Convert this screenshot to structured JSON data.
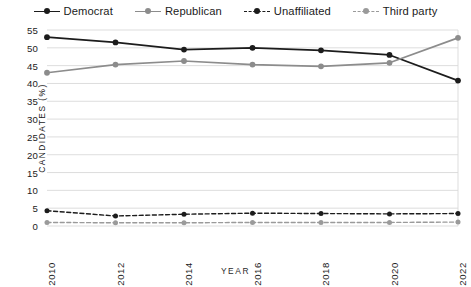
{
  "chart_data": {
    "type": "line",
    "title": "",
    "subtitle": "",
    "xlabel": "YEAR",
    "ylabel": "CANDIDATES (%)",
    "x": [
      2010,
      2012,
      2014,
      2016,
      2018,
      2020,
      2022
    ],
    "xtick_labels": [
      "2010",
      "2012",
      "2014",
      "2016",
      "2018",
      "2020",
      "2022"
    ],
    "ylim": [
      0,
      55
    ],
    "yticks": [
      0,
      5,
      10,
      15,
      20,
      25,
      30,
      35,
      40,
      45,
      50,
      55
    ],
    "ytick_labels": [
      "0",
      "5",
      "10",
      "15",
      "20",
      "25",
      "30",
      "35",
      "40",
      "45",
      "50",
      "55"
    ],
    "grid": true,
    "grid_axis": "y",
    "legend_position": "top",
    "series": [
      {
        "name": "Democrat",
        "color": "#1c1c1c",
        "style": "solid",
        "marker": "circle",
        "values": [
          53.0,
          51.5,
          49.5,
          50.0,
          49.3,
          48.0,
          40.8
        ]
      },
      {
        "name": "Republican",
        "color": "#8c8c8c",
        "style": "solid",
        "marker": "circle",
        "values": [
          43.0,
          45.3,
          46.3,
          45.3,
          44.8,
          45.8,
          52.8
        ]
      },
      {
        "name": "Unaffiliated",
        "color": "#1c1c1c",
        "style": "dotted",
        "marker": "circle",
        "values": [
          4.3,
          2.8,
          3.3,
          3.6,
          3.5,
          3.4,
          3.5
        ]
      },
      {
        "name": "Third party",
        "color": "#9a9a9a",
        "style": "dotted",
        "marker": "circle",
        "values": [
          1.0,
          0.9,
          0.9,
          1.0,
          1.0,
          1.0,
          1.1
        ]
      }
    ]
  },
  "colors": {
    "background": "#ffffff",
    "text": "#1b1b1b",
    "grid": "#d9d9d9",
    "democrat": "#1c1c1c",
    "republican": "#8c8c8c",
    "unaffiliated": "#1c1c1c",
    "third_party": "#9a9a9a"
  }
}
